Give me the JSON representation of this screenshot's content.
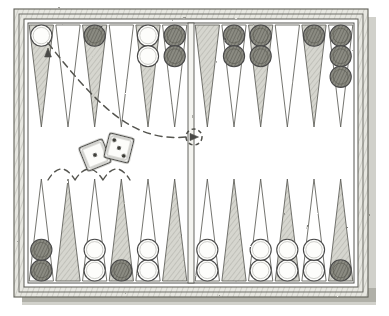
{
  "figure": {
    "style": "hand-drawn pen-and-ink illustration",
    "width": 389,
    "height": 316
  },
  "colors": {
    "ink": "#4a4a4a",
    "ink_dark": "#3d3d3d",
    "point_shaded": "#c9c9c2",
    "point_light": "#ffffff",
    "checker_white_fill": "#fdfdfb",
    "checker_dark_fill": "#7a7a72",
    "checker_outline": "#4a4a4a",
    "board_face": "#fefefe",
    "frame": "#6b6b64",
    "shadow": "#b9b9b2",
    "dash": "#555550",
    "die_face": "#fcfcfa",
    "die_pip": "#3a3a36"
  },
  "board": {
    "frame_label": "board-frame",
    "outer_rect": {
      "x": 14,
      "y": 9,
      "w": 354,
      "h": 288
    },
    "inner_rect": {
      "x": 19,
      "y": 14,
      "w": 344,
      "h": 278
    },
    "play_rect": {
      "x": 28,
      "y": 23,
      "w": 326,
      "h": 260
    },
    "shadow_offset": {
      "x": 8,
      "y": 8
    },
    "bar": {
      "x": 188,
      "y": 23,
      "w": 6,
      "h": 260
    },
    "point_count": 24,
    "point_width": 26.6,
    "point_height": 102,
    "top_y": 25,
    "bottom_y": 281
  },
  "points": [
    {
      "id": 1,
      "quadrant": "top-left",
      "index_in_quadrant": 0,
      "shaded": true,
      "checkers": {
        "color": "white",
        "count": 1
      }
    },
    {
      "id": 2,
      "quadrant": "top-left",
      "index_in_quadrant": 1,
      "shaded": false,
      "checkers": {
        "color": null,
        "count": 0
      }
    },
    {
      "id": 3,
      "quadrant": "top-left",
      "index_in_quadrant": 2,
      "shaded": true,
      "checkers": {
        "color": "dark",
        "count": 1
      }
    },
    {
      "id": 4,
      "quadrant": "top-left",
      "index_in_quadrant": 3,
      "shaded": false,
      "checkers": {
        "color": null,
        "count": 0
      }
    },
    {
      "id": 5,
      "quadrant": "top-left",
      "index_in_quadrant": 4,
      "shaded": true,
      "checkers": {
        "color": "white",
        "count": 2
      }
    },
    {
      "id": 6,
      "quadrant": "top-left",
      "index_in_quadrant": 5,
      "shaded": false,
      "checkers": {
        "color": "dark",
        "count": 2
      }
    },
    {
      "id": 7,
      "quadrant": "top-right",
      "index_in_quadrant": 0,
      "shaded": true,
      "checkers": {
        "color": null,
        "count": 0
      }
    },
    {
      "id": 8,
      "quadrant": "top-right",
      "index_in_quadrant": 1,
      "shaded": false,
      "checkers": {
        "color": "dark",
        "count": 2
      }
    },
    {
      "id": 9,
      "quadrant": "top-right",
      "index_in_quadrant": 2,
      "shaded": true,
      "checkers": {
        "color": "dark",
        "count": 2
      }
    },
    {
      "id": 10,
      "quadrant": "top-right",
      "index_in_quadrant": 3,
      "shaded": false,
      "checkers": {
        "color": null,
        "count": 0
      }
    },
    {
      "id": 11,
      "quadrant": "top-right",
      "index_in_quadrant": 4,
      "shaded": true,
      "checkers": {
        "color": "dark",
        "count": 1
      }
    },
    {
      "id": 12,
      "quadrant": "top-right",
      "index_in_quadrant": 5,
      "shaded": false,
      "checkers": {
        "color": "dark",
        "count": 3
      }
    },
    {
      "id": 13,
      "quadrant": "bottom-right",
      "index_in_quadrant": 5,
      "shaded": true,
      "checkers": {
        "color": "dark",
        "count": 1
      }
    },
    {
      "id": 14,
      "quadrant": "bottom-right",
      "index_in_quadrant": 4,
      "shaded": false,
      "checkers": {
        "color": "white",
        "count": 2
      }
    },
    {
      "id": 15,
      "quadrant": "bottom-right",
      "index_in_quadrant": 3,
      "shaded": true,
      "checkers": {
        "color": "white",
        "count": 2
      }
    },
    {
      "id": 16,
      "quadrant": "bottom-right",
      "index_in_quadrant": 2,
      "shaded": false,
      "checkers": {
        "color": "white",
        "count": 2
      }
    },
    {
      "id": 17,
      "quadrant": "bottom-right",
      "index_in_quadrant": 1,
      "shaded": true,
      "checkers": {
        "color": null,
        "count": 0
      }
    },
    {
      "id": 18,
      "quadrant": "bottom-right",
      "index_in_quadrant": 0,
      "shaded": false,
      "checkers": {
        "color": "white",
        "count": 2
      }
    },
    {
      "id": 19,
      "quadrant": "bottom-left",
      "index_in_quadrant": 5,
      "shaded": true,
      "checkers": {
        "color": null,
        "count": 0
      }
    },
    {
      "id": 20,
      "quadrant": "bottom-left",
      "index_in_quadrant": 4,
      "shaded": false,
      "checkers": {
        "color": "white",
        "count": 2
      }
    },
    {
      "id": 21,
      "quadrant": "bottom-left",
      "index_in_quadrant": 3,
      "shaded": true,
      "checkers": {
        "color": "dark",
        "count": 1
      }
    },
    {
      "id": 22,
      "quadrant": "bottom-left",
      "index_in_quadrant": 2,
      "shaded": false,
      "checkers": {
        "color": "white",
        "count": 2
      }
    },
    {
      "id": 23,
      "quadrant": "bottom-left",
      "index_in_quadrant": 1,
      "shaded": true,
      "checkers": {
        "color": null,
        "count": 0
      }
    },
    {
      "id": 24,
      "quadrant": "bottom-left",
      "index_in_quadrant": 0,
      "shaded": false,
      "checkers": {
        "color": "dark",
        "count": 2
      }
    }
  ],
  "dice": [
    {
      "name": "die-left",
      "value": 1,
      "center": {
        "x": 95,
        "y": 155
      },
      "size": 25,
      "rotation": -22,
      "pips": [
        {
          "x": 0,
          "y": 0
        }
      ]
    },
    {
      "name": "die-right",
      "value": 3,
      "center": {
        "x": 119,
        "y": 148
      },
      "size": 25,
      "rotation": 14,
      "pips": [
        {
          "x": -6.5,
          "y": -6.5
        },
        {
          "x": 0,
          "y": 0
        },
        {
          "x": 6.5,
          "y": 6.5
        }
      ]
    }
  ],
  "annotations": {
    "bar_marker": {
      "name": "bar-target-marker",
      "center": {
        "x": 194,
        "y": 137
      },
      "radius": 8,
      "note": "dashed circle with arrowhead on the bar"
    },
    "sweep_path": {
      "name": "move-arc-to-point-1",
      "description": "long dashed curve sweeping from the bar leftward and up to the top-left point",
      "from": {
        "x": 186,
        "y": 137
      },
      "to": {
        "x": 48,
        "y": 43
      }
    },
    "vertical_path": {
      "name": "move-line-left-edge",
      "description": "dashed vertical line running down the left side of the board",
      "from": {
        "x": 48,
        "y": 122
      },
      "to": {
        "x": 48,
        "y": 178
      }
    },
    "hop_arcs": {
      "name": "move-hop-arcs",
      "count": 3,
      "description": "three dashed hop arcs along the bottom-left points",
      "baseline_y": 180,
      "spans": [
        {
          "from_x": 48,
          "to_x": 75
        },
        {
          "from_x": 75,
          "to_x": 103
        },
        {
          "from_x": 103,
          "to_x": 130
        }
      ]
    },
    "descent_line": {
      "name": "move-line-into-point-21",
      "description": "dashed line descending into the fourth point of the bottom-left quadrant",
      "from": {
        "x": 130,
        "y": 182
      },
      "to": {
        "x": 130,
        "y": 250
      }
    },
    "arrowhead_top": {
      "name": "arrowhead-into-point-1",
      "at": {
        "x": 48,
        "y": 48
      },
      "direction": "up"
    }
  }
}
